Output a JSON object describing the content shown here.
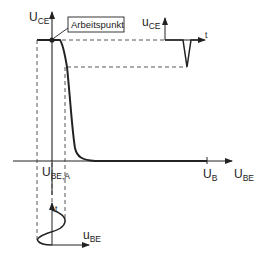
{
  "diagram": {
    "labels": {
      "y_axis_main": "U",
      "y_axis_sub": "CE",
      "x_axis_main": "U",
      "x_axis_sub": "BE",
      "operating_point": "Arbeitspunkt",
      "ube_a_main": "U",
      "ube_a_sub": "BE,A",
      "ub_main": "U",
      "ub_sub": "B",
      "output_signal_main": "u",
      "output_signal_sub": "CE",
      "output_time": "t",
      "input_signal_main": "u",
      "input_signal_sub": "BE",
      "input_time": "t"
    },
    "colors": {
      "line": "#222222",
      "dashed": "#444444",
      "background": "#ffffff"
    }
  }
}
